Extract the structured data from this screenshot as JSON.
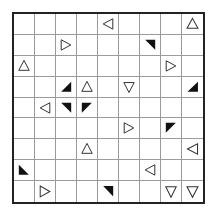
{
  "puzzle": {
    "rows": 9,
    "cols": 9,
    "colors": {
      "grid_line": "#9a9a9a",
      "border": "#222222",
      "shape_fill": "#111111",
      "outline": "#333333"
    },
    "cells": [
      {
        "r": 0,
        "c": 4,
        "type": "outline",
        "dir": "left"
      },
      {
        "r": 0,
        "c": 8,
        "type": "outline",
        "dir": "up"
      },
      {
        "r": 1,
        "c": 2,
        "type": "outline",
        "dir": "right"
      },
      {
        "r": 1,
        "c": 6,
        "type": "black",
        "corner": "ne"
      },
      {
        "r": 2,
        "c": 0,
        "type": "outline",
        "dir": "up"
      },
      {
        "r": 2,
        "c": 7,
        "type": "outline",
        "dir": "right"
      },
      {
        "r": 3,
        "c": 2,
        "type": "black",
        "corner": "se"
      },
      {
        "r": 3,
        "c": 3,
        "type": "outline",
        "dir": "up"
      },
      {
        "r": 3,
        "c": 5,
        "type": "outline",
        "dir": "down"
      },
      {
        "r": 3,
        "c": 8,
        "type": "black",
        "corner": "se"
      },
      {
        "r": 4,
        "c": 1,
        "type": "outline",
        "dir": "left"
      },
      {
        "r": 4,
        "c": 2,
        "type": "black",
        "corner": "ne"
      },
      {
        "r": 4,
        "c": 3,
        "type": "black",
        "corner": "nw"
      },
      {
        "r": 5,
        "c": 5,
        "type": "outline",
        "dir": "right"
      },
      {
        "r": 5,
        "c": 7,
        "type": "black",
        "corner": "nw"
      },
      {
        "r": 6,
        "c": 3,
        "type": "outline",
        "dir": "up"
      },
      {
        "r": 6,
        "c": 8,
        "type": "outline",
        "dir": "left"
      },
      {
        "r": 7,
        "c": 0,
        "type": "black",
        "corner": "sw"
      },
      {
        "r": 7,
        "c": 6,
        "type": "outline",
        "dir": "left"
      },
      {
        "r": 8,
        "c": 1,
        "type": "outline",
        "dir": "right"
      },
      {
        "r": 8,
        "c": 4,
        "type": "black",
        "corner": "ne"
      },
      {
        "r": 8,
        "c": 7,
        "type": "outline",
        "dir": "down"
      },
      {
        "r": 8,
        "c": 8,
        "type": "outline",
        "dir": "down"
      }
    ]
  }
}
